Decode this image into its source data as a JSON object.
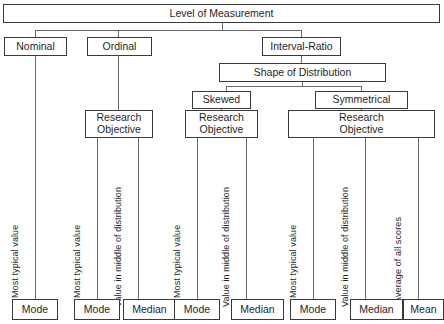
{
  "diagram": {
    "title": "Level of Measurement",
    "type": "hierarchy-flowchart",
    "root": {
      "label": "Level of Measurement"
    },
    "levels": [
      {
        "id": "nominal",
        "label": "Nominal"
      },
      {
        "id": "ordinal",
        "label": "Ordinal"
      },
      {
        "id": "interval_ratio",
        "label": "Interval-Ratio"
      }
    ],
    "shape_node": {
      "label": "Shape of Distribution"
    },
    "shapes": [
      {
        "id": "skewed",
        "label": "Skewed"
      },
      {
        "id": "symmetrical",
        "label": "Symmetrical"
      }
    ],
    "research_objectives": [
      {
        "id": "ro_ordinal",
        "label": "Research\nObjective"
      },
      {
        "id": "ro_skewed",
        "label": "Research\nObjective"
      },
      {
        "id": "ro_symmetrical",
        "label": "Research\nObjective"
      }
    ],
    "criteria": [
      {
        "id": "c1",
        "text": "Most typical  value"
      },
      {
        "id": "c2",
        "text": "Most typical  value"
      },
      {
        "id": "c3",
        "text": "Value in middle of distribution"
      },
      {
        "id": "c4",
        "text": "Most typical  value"
      },
      {
        "id": "c5",
        "text": "Value in middle of distribution"
      },
      {
        "id": "c6",
        "text": "Most typical  value"
      },
      {
        "id": "c7",
        "text": "Value in middle of distribution"
      },
      {
        "id": "c8",
        "text": "Average of all scores"
      }
    ],
    "measures": [
      {
        "id": "m1",
        "label": "Mode"
      },
      {
        "id": "m2",
        "label": "Mode"
      },
      {
        "id": "m3",
        "label": "Median"
      },
      {
        "id": "m4",
        "label": "Mode"
      },
      {
        "id": "m5",
        "label": "Median"
      },
      {
        "id": "m6",
        "label": "Mode"
      },
      {
        "id": "m7",
        "label": "Median"
      },
      {
        "id": "m8",
        "label": "Mean"
      }
    ],
    "colors": {
      "box_border": "#3a3a3a",
      "connector": "#6a6a6a",
      "text": "#1f1f1f",
      "background": "#ffffff"
    }
  }
}
